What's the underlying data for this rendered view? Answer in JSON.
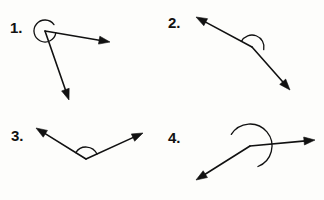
{
  "page": {
    "background_color": "#fdfdfb",
    "ink_color": "#111111",
    "width": 324,
    "height": 200
  },
  "items": [
    {
      "label": "1.",
      "name": "angle-figure-1",
      "label_x": 10,
      "label_y": 20,
      "vertex": [
        45,
        31
      ],
      "ray_tips": [
        [
          110,
          42
        ],
        [
          69,
          100
        ]
      ],
      "ray_angles_deg": [
        9.6,
        54.6
      ],
      "arc_radius": 11,
      "arc_type": "reflex",
      "arc_start_deg": 9.6,
      "arc_sweep_deg": 315,
      "angle_measure_deg": 315,
      "angle_classification": "reflex"
    },
    {
      "label": "2.",
      "name": "angle-figure-2",
      "label_x": 168,
      "label_y": 15,
      "vertex": [
        252,
        47
      ],
      "ray_tips": [
        [
          196,
          17
        ],
        [
          290,
          90
        ]
      ],
      "ray_angles_deg": [
        208.2,
        44.4
      ],
      "arc_radius": 12,
      "arc_type": "interior",
      "arc_start_deg": 208.2,
      "arc_sweep_deg": 164,
      "angle_measure_deg": 164,
      "angle_classification": "obtuse"
    },
    {
      "label": "3.",
      "name": "angle-figure-3",
      "label_x": 11,
      "label_y": 128,
      "vertex": [
        86,
        159
      ],
      "ray_tips": [
        [
          36,
          128
        ],
        [
          143,
          133
        ]
      ],
      "ray_angles_deg": [
        211.8,
        335.3
      ],
      "arc_radius": 12,
      "arc_type": "interior",
      "arc_start_deg": 211.8,
      "arc_sweep_deg": 124,
      "angle_measure_deg": 124,
      "angle_classification": "obtuse"
    },
    {
      "label": "4.",
      "name": "angle-figure-4",
      "label_x": 168,
      "label_y": 130,
      "vertex": [
        250,
        146
      ],
      "ray_tips": [
        [
          315,
          140
        ],
        [
          196,
          180
        ]
      ],
      "ray_angles_deg": [
        354.7,
        211.8
      ],
      "arc_radius": 22,
      "arc_type": "interior",
      "arc_start_deg": 211.8,
      "arc_sweep_deg": 217,
      "angle_measure_deg": 217,
      "angle_classification": "reflex"
    }
  ],
  "style": {
    "stroke_width": 1.6,
    "arc_stroke_width": 1.3,
    "arrowhead_length": 11,
    "arrowhead_half_width": 4
  }
}
